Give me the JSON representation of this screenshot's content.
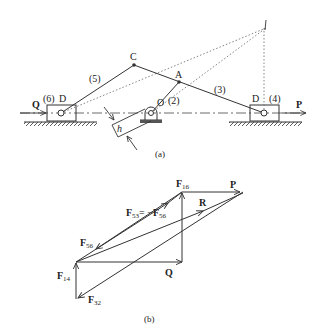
{
  "figure_a": {
    "caption": "(a)",
    "labels": {
      "C": "C",
      "A": "A",
      "O": "O",
      "D_left": "D",
      "D_right": "D",
      "link5": "(5)",
      "link3": "(3)",
      "link2": "(2)",
      "link6": "(6)",
      "link4": "(4)",
      "Q": "Q",
      "P": "P",
      "h": "h"
    }
  },
  "figure_b": {
    "caption": "(b)",
    "labels": {
      "F16_main": "F",
      "F16_sub": "16",
      "P": "P",
      "R": "R",
      "F53_main": "F",
      "F53_sub": "53",
      "eq": "= −",
      "F56a_main": "F",
      "F56a_sub": "56",
      "F56b_main": "F",
      "F56b_sub": "56",
      "F14_main": "F",
      "F14_sub": "14",
      "Q": "Q",
      "F32_main": "F",
      "F32_sub": "32"
    }
  },
  "colors": {
    "line": "#333333",
    "text": "#222222"
  }
}
